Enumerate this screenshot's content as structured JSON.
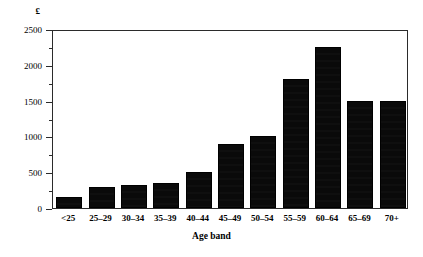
{
  "chart_data": {
    "type": "bar",
    "title": "",
    "xlabel": "Age band",
    "ylabel": "£",
    "categories": [
      "<25",
      "25–29",
      "30–34",
      "35–39",
      "40–44",
      "45–49",
      "50–54",
      "55–59",
      "60–64",
      "65–69",
      "70+"
    ],
    "values": [
      150,
      300,
      320,
      350,
      500,
      900,
      1000,
      1800,
      2250,
      1500,
      1500
    ],
    "ylim": [
      0,
      2500
    ],
    "ytick_labels": [
      "0",
      "500",
      "1000",
      "1500",
      "2000",
      "2500"
    ],
    "ytick_values": [
      0,
      500,
      1000,
      1500,
      2000,
      2500
    ],
    "yminor_tick_values": [
      250,
      750,
      1250,
      1750,
      2250
    ],
    "grid": false,
    "legend": "none",
    "bar_color": "#0a0a0a",
    "axis_color": "#2b2b2b",
    "background": "#ffffff"
  },
  "axis": {
    "unit_label": "£",
    "x_title": "Age band"
  }
}
